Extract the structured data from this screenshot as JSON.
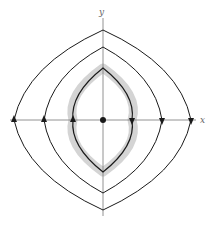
{
  "diagram": {
    "type": "phase-portrait",
    "axes": {
      "x_label": "x",
      "y_label": "y"
    },
    "origin": {
      "label": "equilibrium point",
      "marker": "filled-dot"
    },
    "orbits": [
      {
        "name": "outer-orbit",
        "direction": "clockwise",
        "highlighted": false
      },
      {
        "name": "middle-orbit",
        "direction": "clockwise",
        "highlighted": false
      },
      {
        "name": "inner-orbit",
        "direction": "clockwise",
        "highlighted": true
      }
    ],
    "colors": {
      "curve": "#1a1a1a",
      "axis": "#777777",
      "highlight": "#d4d4d4"
    }
  }
}
